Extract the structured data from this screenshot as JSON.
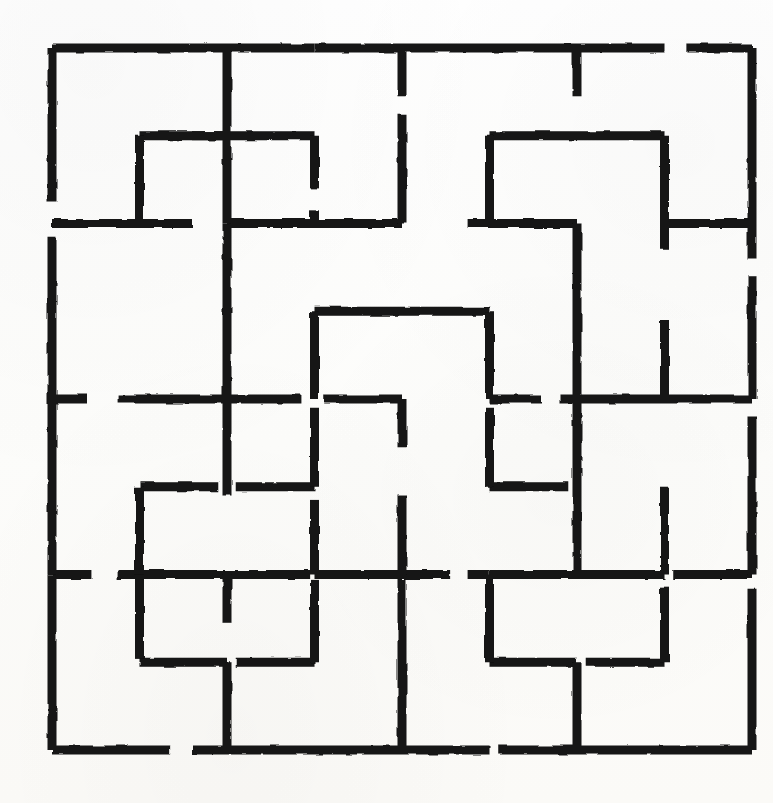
{
  "document": {
    "kind": "maze-puzzle",
    "title": "Square grid maze",
    "medium": "hand-drawn ink on white paper",
    "canvas_width": 773,
    "canvas_height": 803
  },
  "colors": {
    "ink": "#121212",
    "paper": "#fdfdfb"
  },
  "maze": {
    "columns": 8,
    "rows": 8,
    "origin_x": 52,
    "origin_y": 48,
    "cell_width": 87.5,
    "cell_height": 87.75,
    "stroke_width": 9,
    "notes": "Walls lie on grid lines. h = horizontal wall segments, v = vertical wall segments. Each entry is [gridCol, gridRow, lengthInCells] in grid units measured from the origin.",
    "walls_horizontal": [
      [
        0,
        0,
        2
      ],
      [
        2,
        0,
        1
      ],
      [
        3,
        0,
        1
      ],
      [
        4,
        0,
        3
      ],
      [
        7.25,
        0,
        0.75
      ],
      [
        1,
        1,
        1
      ],
      [
        1.6,
        1,
        1.4
      ],
      [
        5,
        1,
        2
      ],
      [
        0,
        2,
        1.6
      ],
      [
        2,
        2,
        2
      ],
      [
        4.75,
        2,
        1.25
      ],
      [
        7,
        2,
        1
      ],
      [
        3,
        3,
        2
      ],
      [
        0,
        4,
        0.4
      ],
      [
        0.75,
        4,
        2.1
      ],
      [
        3.1,
        4,
        0.9
      ],
      [
        5,
        4,
        0.6
      ],
      [
        5.8,
        4,
        2.2
      ],
      [
        1,
        5,
        0.9
      ],
      [
        2.1,
        5,
        0.9
      ],
      [
        5,
        5,
        0.9
      ],
      [
        3,
        6,
        1.55
      ],
      [
        4.75,
        6,
        0.25
      ],
      [
        0,
        6,
        0.45
      ],
      [
        0.75,
        6,
        2.2
      ],
      [
        5,
        6,
        2
      ],
      [
        7.1,
        6,
        0.9
      ],
      [
        1,
        7,
        1
      ],
      [
        2.1,
        7,
        0.9
      ],
      [
        5,
        7,
        1
      ],
      [
        6.1,
        7,
        0.9
      ],
      [
        0,
        8,
        1.35
      ],
      [
        1.6,
        8,
        3.4
      ],
      [
        5.1,
        8,
        2.9
      ]
    ],
    "walls_vertical": [
      [
        0,
        0,
        1.75
      ],
      [
        2,
        0,
        2
      ],
      [
        4,
        0,
        0.55
      ],
      [
        4,
        0.75,
        1.25
      ],
      [
        6,
        0,
        0.55
      ],
      [
        8,
        0,
        2.4
      ],
      [
        1,
        1,
        1
      ],
      [
        3,
        1,
        0.6
      ],
      [
        3,
        1.85,
        0.15
      ],
      [
        5,
        1,
        1
      ],
      [
        7,
        1,
        1.3
      ],
      [
        0,
        2.15,
        1.85
      ],
      [
        2,
        2,
        2
      ],
      [
        6,
        2,
        2
      ],
      [
        8,
        2.6,
        1.4
      ],
      [
        3,
        3,
        1
      ],
      [
        3,
        4.1,
        0.9
      ],
      [
        5,
        3,
        1
      ],
      [
        5,
        4.1,
        0.9
      ],
      [
        7,
        3.1,
        0.9
      ],
      [
        0,
        4,
        2
      ],
      [
        2,
        4,
        1.1
      ],
      [
        4,
        4,
        0.55
      ],
      [
        4,
        5.1,
        0.9
      ],
      [
        6,
        4,
        2
      ],
      [
        8,
        4.2,
        1.8
      ],
      [
        1,
        5,
        1
      ],
      [
        3,
        5.15,
        0.85
      ],
      [
        7,
        5,
        1
      ],
      [
        0,
        6,
        2
      ],
      [
        1,
        6,
        0.95
      ],
      [
        2,
        6,
        0.55
      ],
      [
        3,
        6.05,
        0.95
      ],
      [
        4,
        6.05,
        1.95
      ],
      [
        5,
        6,
        1
      ],
      [
        7,
        6.15,
        0.85
      ],
      [
        8,
        6.15,
        1.85
      ],
      [
        2,
        7,
        1
      ],
      [
        6,
        7,
        1
      ]
    ]
  }
}
